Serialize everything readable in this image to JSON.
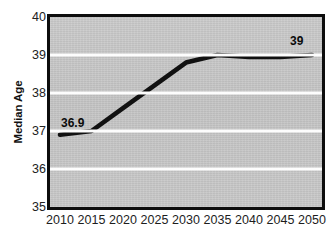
{
  "chart_data": {
    "type": "line",
    "title": "",
    "subtitle": "",
    "xlabel": "",
    "ylabel": "Median Age",
    "x": [
      2010,
      2015,
      2020,
      2025,
      2030,
      2035,
      2040,
      2045,
      2050
    ],
    "categories": [
      "2010",
      "2015",
      "2020",
      "2025",
      "2030",
      "2035",
      "2040",
      "2045",
      "2050"
    ],
    "values": [
      36.9,
      37.0,
      37.6,
      38.2,
      38.8,
      39.0,
      38.95,
      38.95,
      39.0
    ],
    "series": [
      {
        "name": "Median Age",
        "values": [
          36.9,
          37.0,
          37.6,
          38.2,
          38.8,
          39.0,
          38.95,
          38.95,
          39.0
        ],
        "color": "#111111"
      }
    ],
    "ylim": [
      35,
      40
    ],
    "xlim": [
      2010,
      2050
    ],
    "yticks": [
      40,
      39,
      38,
      37,
      36,
      35
    ],
    "ytick_labels": [
      "40",
      "39",
      "38",
      "37",
      "36",
      "35"
    ],
    "xtick_labels": [
      "2010",
      "2015",
      "2020",
      "2025",
      "2030",
      "2035",
      "2040",
      "2045",
      "2050"
    ],
    "gridlines": [
      39,
      38,
      37,
      36
    ],
    "grid": true,
    "legend": "none",
    "annotations": [
      {
        "text": "36.9",
        "x": 2010,
        "y": 36.9,
        "position": "above-right"
      },
      {
        "text": "39",
        "x": 2050,
        "y": 39.0,
        "position": "above-left"
      }
    ],
    "plot_background": "#c9c9c9",
    "gridline_color": "#fdfdfd",
    "border_color": "#0d0d0d",
    "line_color": "#111111"
  }
}
